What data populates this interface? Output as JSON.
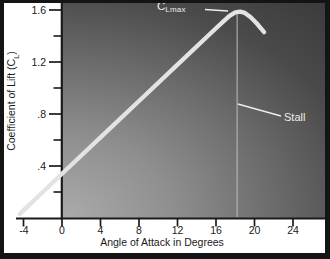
{
  "chart_data": {
    "type": "line",
    "title": "",
    "xlabel": "Angle of Attack in Degrees",
    "ylabel": "Coefficient of Lift (C_L)",
    "ylabel_parts": {
      "prefix": "Coefficient of Lift (C",
      "sub": "L",
      "suffix": ")"
    },
    "xlim": [
      -4.8,
      27.4
    ],
    "ylim": [
      0,
      1.68
    ],
    "grid": false,
    "legend": "none",
    "xticks": [
      {
        "label": "-4",
        "value": -4
      },
      {
        "label": "0",
        "value": 0
      },
      {
        "label": "4",
        "value": 4
      },
      {
        "label": "8",
        "value": 8
      },
      {
        "label": "12",
        "value": 12
      },
      {
        "label": "16",
        "value": 16
      },
      {
        "label": "20",
        "value": 20
      },
      {
        "label": "24",
        "value": 24
      }
    ],
    "yticks": [
      {
        "label": "1.6",
        "value": 1.6
      },
      {
        "label": "1.2",
        "value": 1.2
      },
      {
        "label": ".8",
        "value": 0.8
      },
      {
        "label": ".4",
        "value": 0.4
      }
    ],
    "yticks_minor": [
      0.2,
      0.6,
      1.0,
      1.4
    ],
    "series": [
      {
        "name": "lift-coefficient-curve",
        "color": "#e3e3e3",
        "points": [
          [
            -4.4,
            0.03
          ],
          [
            0,
            0.34
          ],
          [
            4,
            0.62
          ],
          [
            8,
            0.9
          ],
          [
            12,
            1.18
          ],
          [
            16,
            1.46
          ],
          [
            16.8,
            1.515
          ],
          [
            17.4,
            1.555
          ],
          [
            18.0,
            1.582
          ],
          [
            18.5,
            1.588
          ],
          [
            19.0,
            1.578
          ],
          [
            19.6,
            1.545
          ],
          [
            20.2,
            1.5
          ],
          [
            21.0,
            1.43
          ]
        ]
      }
    ],
    "annotations": {
      "clmax": {
        "prefix": "C",
        "sub": "Lmax",
        "angle": 18.5,
        "cl": 1.59
      },
      "stall": {
        "label": "Stall",
        "angle": 18.2,
        "marker": "vertical-line"
      }
    },
    "colors": {
      "plot_bg_light": "#ababab",
      "plot_bg_dark": "#3b3b3b",
      "curve": "#e3e3e3",
      "axis": "#1a1a1a",
      "annotation": "#ededed",
      "stall_line": "#c9c9c9",
      "margin_bg": "#ffffff",
      "frame": "#141414"
    }
  }
}
